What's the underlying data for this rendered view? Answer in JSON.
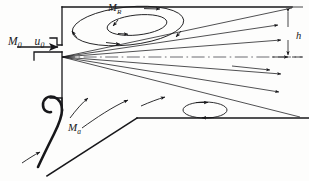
{
  "figure": {
    "type": "technical-line-diagram",
    "background_color": "#fdfdfc",
    "ink_color": "#17171a"
  },
  "labels": {
    "inlet_momentum": {
      "symbol": "M",
      "subscript": "0"
    },
    "inlet_velocity": {
      "symbol": "u",
      "subscript": "0"
    },
    "recirculation": {
      "symbol": "M",
      "subscript": "R"
    },
    "entrained_air": {
      "symbol": "M",
      "subscript": "a"
    },
    "duct_height": {
      "symbol": "h",
      "subscript": ""
    }
  },
  "geometry": {
    "canvas": {
      "width": 309,
      "height": 181
    },
    "nozzle_origin": {
      "x": 62,
      "y": 57
    },
    "top_wall": {
      "x1": 62,
      "y1": 7,
      "x2": 292,
      "y2": 7
    },
    "vertical_wall": {
      "x1": 62,
      "y1": 7,
      "x2": 62,
      "y2": 110
    },
    "floor_line": {
      "x1": 137,
      "y1": 118,
      "x2": 309,
      "y2": 118
    },
    "ramp_line": {
      "x1": 47,
      "y1": 176,
      "x2": 137,
      "y2": 118
    },
    "centerline": {
      "x1": 62,
      "y1": 57,
      "x2": 300,
      "y2": 57,
      "style": "dash-dot"
    },
    "dimension_h": {
      "x": 288,
      "y_top": 7,
      "y_bottom": 57
    }
  },
  "flow_features": {
    "inlet_arrow": {
      "x1": 18,
      "y1": 47,
      "x2": 61,
      "y2": 47,
      "direction": "right"
    },
    "jet_rays": [
      {
        "x1": 62,
        "y1": 57,
        "x2": 292,
        "y2": 7,
        "arrow": false
      },
      {
        "x1": 62,
        "y1": 57,
        "x2": 285,
        "y2": 25,
        "arrow": true
      },
      {
        "x1": 62,
        "y1": 57,
        "x2": 287,
        "y2": 39,
        "arrow": true
      },
      {
        "x1": 62,
        "y1": 57,
        "x2": 290,
        "y2": 57,
        "arrow": false
      },
      {
        "x1": 62,
        "y1": 57,
        "x2": 287,
        "y2": 76,
        "arrow": true
      },
      {
        "x1": 62,
        "y1": 57,
        "x2": 285,
        "y2": 93,
        "arrow": true
      },
      {
        "x1": 62,
        "y1": 57,
        "x2": 299,
        "y2": 117,
        "arrow": false
      }
    ],
    "upper_vortex": {
      "outer_loop": {
        "cx": 128,
        "cy": 26,
        "rx": 56,
        "ry": 19,
        "rotation": -6,
        "sense": "clockwise"
      },
      "inner_loop": {
        "cx": 137,
        "cy": 25,
        "rx": 30,
        "ry": 10,
        "rotation": -6,
        "sense": "clockwise"
      }
    },
    "lower_vortex": {
      "cx": 205,
      "cy": 110,
      "rx": 22,
      "ry": 8,
      "sense": "clockwise"
    },
    "entrainment_arrows": 4,
    "entrainment_lip": {
      "description": "thick hooked wall at lower left",
      "x": 45,
      "y": 100
    }
  }
}
